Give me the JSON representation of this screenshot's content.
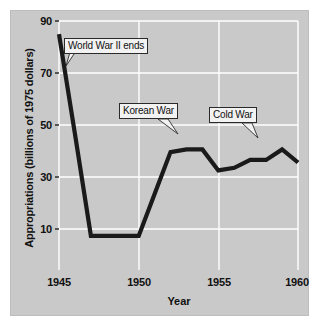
{
  "chart_data": {
    "type": "line",
    "title": "",
    "xlabel": "Year",
    "ylabel": "Appropriations (billions of 1975 dollars)",
    "xlim": [
      1945,
      1960
    ],
    "ylim": [
      0,
      95
    ],
    "xticks": [
      "1945",
      "1950",
      "1955",
      "1960"
    ],
    "yticks": [
      "10",
      "30",
      "50",
      "70",
      "90"
    ],
    "grid": true,
    "legend": "none",
    "line_color": "#1a1a1a",
    "plot_background": "#c9c9c9",
    "gridline_color": "#ffffff",
    "x": [
      1945,
      1946,
      1947,
      1948,
      1949,
      1950,
      1951,
      1952,
      1953,
      1954,
      1955,
      1956,
      1957,
      1958,
      1959,
      1960
    ],
    "values": [
      90,
      52,
      13,
      13,
      13,
      13,
      29,
      45,
      46,
      46,
      38,
      39,
      42,
      42,
      46,
      41
    ],
    "annotations": [
      {
        "label": "World War II ends",
        "x": 1946,
        "y": 70
      },
      {
        "label": "Korean War",
        "x": 1951.6,
        "y": 50
      },
      {
        "label": "Cold War",
        "x": 1957.6,
        "y": 50
      }
    ]
  },
  "axes": {
    "y_title": "Appropriations (billions of 1975 dollars)",
    "x_title": "Year",
    "y_tick_labels": [
      "90",
      "70",
      "50",
      "30",
      "10"
    ],
    "x_tick_labels": [
      "1945",
      "1950",
      "1955",
      "1960"
    ]
  },
  "callouts": {
    "ww2": "World War II ends",
    "korean": "Korean War",
    "cold": "Cold War"
  }
}
